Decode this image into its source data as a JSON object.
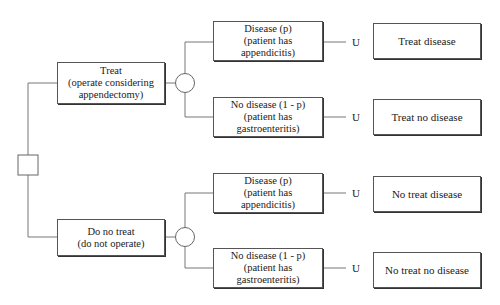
{
  "diagram": {
    "type": "decision-tree",
    "decision_node": {
      "shape": "square"
    },
    "options": [
      {
        "label": "Treat",
        "sublabel": "(operate considering",
        "sublabel2": "appendectomy)",
        "chance_node": {
          "shape": "circle"
        },
        "branches": [
          {
            "label": "Disease (p)",
            "sub1": "(patient has",
            "sub2": "appendicitis)",
            "utility": "U",
            "outcome": "Treat disease"
          },
          {
            "label": "No disease (1 - p)",
            "sub1": "(patient has",
            "sub2": "gastroenteritis)",
            "utility": "U",
            "outcome": "Treat no disease"
          }
        ]
      },
      {
        "label": "Do no treat",
        "sublabel": "(do not operate)",
        "sublabel2": "",
        "chance_node": {
          "shape": "circle"
        },
        "branches": [
          {
            "label": "Disease (p)",
            "sub1": "(patient has",
            "sub2": "appendicitis)",
            "utility": "U",
            "outcome": "No treat disease"
          },
          {
            "label": "No disease (1 - p)",
            "sub1": "(patient has",
            "sub2": "gastroenteritis)",
            "utility": "U",
            "outcome": "No treat no disease"
          }
        ]
      }
    ],
    "colors": {
      "line": "#666666",
      "border": "#555555",
      "text": "#1a1a1a",
      "background": "#ffffff"
    }
  }
}
